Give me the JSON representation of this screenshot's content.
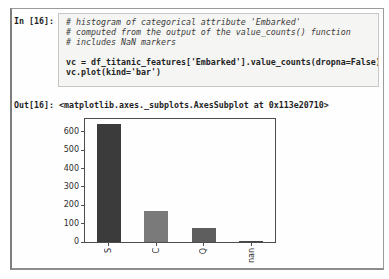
{
  "cell": {
    "in_prompt": "In [16]:",
    "out_prompt": "Out[16]:",
    "code_lines": [
      {
        "text": "# histogram of categorical attribute 'Embarked'",
        "style": "comment"
      },
      {
        "text": "# computed from the output of the value_counts() function",
        "style": "comment"
      },
      {
        "text": "# includes NaN markers",
        "style": "comment"
      },
      {
        "text": "",
        "style": "code"
      },
      {
        "text": "vc = df_titanic_features['Embarked'].value_counts(dropna=False)",
        "style": "code"
      },
      {
        "text": "vc.plot(kind='bar')",
        "style": "code"
      }
    ],
    "out_text": "<matplotlib.axes._subplots.AxesSubplot at 0x113e20710>"
  },
  "chart_data": {
    "type": "bar",
    "categories": [
      "S",
      "C",
      "Q",
      "nan"
    ],
    "values": [
      644,
      168,
      77,
      2
    ],
    "bar_colors": [
      "#3b3b3b",
      "#7a7a7a",
      "#5e5e5e",
      "#454545"
    ],
    "title": "",
    "xlabel": "",
    "ylabel": "",
    "ylim": [
      0,
      670
    ],
    "yticks": [
      0,
      100,
      200,
      300,
      400,
      500,
      600
    ],
    "x_tick_rotation": 90,
    "grid": false,
    "legend": "none",
    "spine_color": "#4d4d4d"
  }
}
